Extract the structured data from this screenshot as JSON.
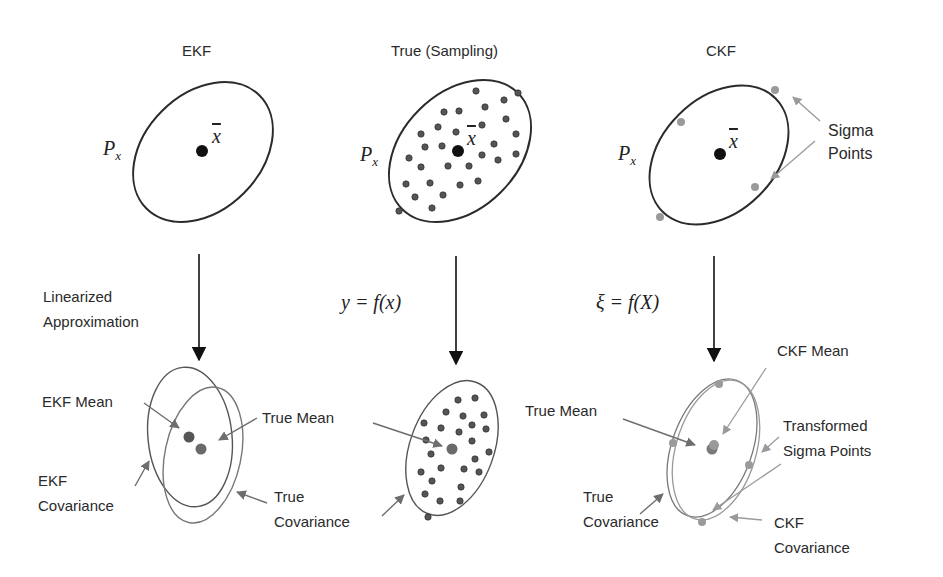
{
  "colors": {
    "line": "#2b2b2b",
    "dark_point": "#111111",
    "sample_point": "#555555",
    "mean_point": "#6a6a6a",
    "grey_arrow": "#8a8a8a",
    "light_point": "#9a9a9a",
    "text": "#2a2a2a"
  },
  "columns": [
    {
      "title": "EKF",
      "cov_label": "P",
      "cov_sub": "x",
      "mean_label": "x",
      "transform_label": "Linearized\nApproximation",
      "bottom": {
        "mean_label": "EKF Mean",
        "true_mean_label": "True Mean",
        "cov_label": "EKF\nCovariance",
        "true_cov_label": "True\nCovariance"
      }
    },
    {
      "title": "True (Sampling)",
      "cov_label": "P",
      "cov_sub": "x",
      "mean_label": "x",
      "transform_label": "y = f(x)",
      "bottom": {
        "true_mean_label": "True Mean",
        "true_cov_label": "True\nCovariance"
      }
    },
    {
      "title": "CKF",
      "cov_label": "P",
      "cov_sub": "x",
      "mean_label": "x",
      "sigma_label": "Sigma\nPoints",
      "transform_label": "ξ = f(X)",
      "bottom": {
        "ckf_mean_label": "CKF Mean",
        "true_mean_label": "True Mean",
        "sigma_label": "Transformed\nSigma Points",
        "true_cov_label": "True\nCovariance",
        "ckf_cov_label": "CKF\nCovariance"
      }
    }
  ]
}
